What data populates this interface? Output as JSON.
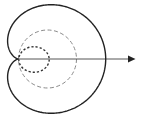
{
  "diagram": {
    "type": "polar-curve",
    "colors": {
      "background": "#ffffff",
      "cardioid": "#222222",
      "large_circle": "#8a8a8a",
      "small_circle": "#333333",
      "axis": "#555555"
    },
    "elements": [
      {
        "name": "cardioid",
        "style": "solid"
      },
      {
        "name": "large-circle",
        "style": "dashed"
      },
      {
        "name": "small-circle",
        "style": "dotted"
      },
      {
        "name": "polar-axis",
        "style": "arrow"
      }
    ]
  }
}
